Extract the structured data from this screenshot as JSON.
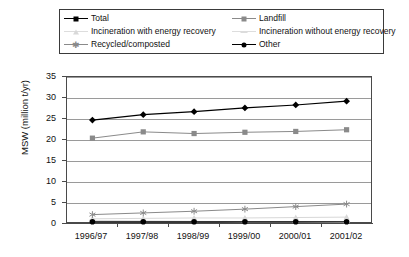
{
  "chart_data": {
    "type": "line",
    "title": "",
    "xlabel": "",
    "ylabel": "MSW (million t/yr)",
    "categories": [
      "1996/97",
      "1997/98",
      "1998/99",
      "1999/00",
      "2000/01",
      "2001/02"
    ],
    "ylim": [
      0,
      35
    ],
    "yticks": [
      0,
      5,
      10,
      15,
      20,
      25,
      30,
      35
    ],
    "grid": true,
    "legend_position": "top",
    "series": [
      {
        "name": "Total",
        "marker": "diamond",
        "color": "#000000",
        "values": [
          24.5,
          25.8,
          26.5,
          27.4,
          28.1,
          29.0
        ]
      },
      {
        "name": "Landfill",
        "marker": "square",
        "color": "#8a8a8a",
        "values": [
          20.2,
          21.7,
          21.3,
          21.6,
          21.8,
          22.2
        ]
      },
      {
        "name": "Incineration with energy recovery",
        "marker": "triangle",
        "color": "#d8d8d8",
        "values": [
          1.0,
          1.1,
          1.2,
          1.2,
          1.3,
          1.4
        ]
      },
      {
        "name": "Incineration without energy recovery",
        "marker": "dash",
        "color": "#dcdcdc",
        "values": [
          0.6,
          0.5,
          0.4,
          0.3,
          0.3,
          0.2
        ]
      },
      {
        "name": "Recycled/composted",
        "marker": "star",
        "color": "#8a8a8a",
        "values": [
          2.0,
          2.4,
          2.8,
          3.3,
          3.9,
          4.5
        ]
      },
      {
        "name": "Other",
        "marker": "circle",
        "color": "#000000",
        "values": [
          0.3,
          0.3,
          0.3,
          0.3,
          0.3,
          0.3
        ]
      }
    ]
  },
  "legend": {
    "items": [
      {
        "label": "Total",
        "marker": "diamond-marker"
      },
      {
        "label": "Landfill",
        "marker": "square-marker"
      },
      {
        "label": "Incineration with energy recovery",
        "marker": "triangle-marker"
      },
      {
        "label": "Incineration without energy recovery",
        "marker": "dash-marker"
      },
      {
        "label": "Recycled/composted",
        "marker": "star-marker"
      },
      {
        "label": "Other",
        "marker": "circle-marker"
      }
    ]
  },
  "axes": {
    "y_title": "MSW (million t/yr)",
    "y_labels": [
      "35",
      "30",
      "25",
      "20",
      "15",
      "10",
      "5",
      "0"
    ],
    "x_labels": [
      "1996/97",
      "1997/98",
      "1998/99",
      "1999/00",
      "2000/01",
      "2001/02"
    ]
  }
}
